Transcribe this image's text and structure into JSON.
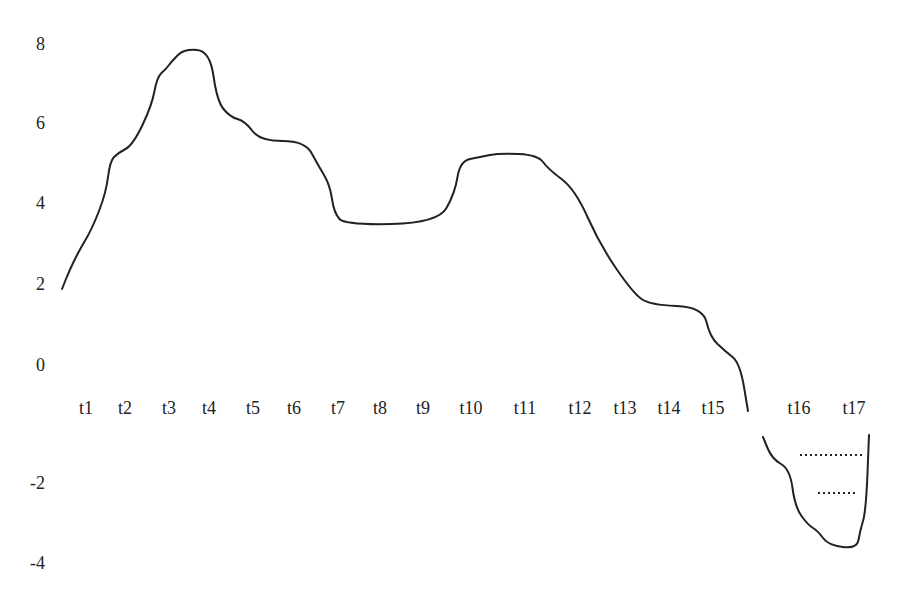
{
  "chart_data": {
    "type": "line",
    "title": "",
    "xlabel": "",
    "ylabel": "",
    "ylim": [
      -4,
      8
    ],
    "grid": false,
    "legend": null,
    "yticks": [
      "8",
      "6",
      "4",
      "2",
      "0",
      "-2",
      "-4"
    ],
    "categories": [
      "t1",
      "t2",
      "t3",
      "t4",
      "t5",
      "t6",
      "t7",
      "t8",
      "t9",
      "t10",
      "t11",
      "t12",
      "t13",
      "t14",
      "t15",
      "t16",
      "t17"
    ],
    "series": [
      {
        "name": "curve",
        "color": "#222222",
        "points": [
          {
            "x": 62,
            "v": 1.9
          },
          {
            "x": 70,
            "v": 2.4
          },
          {
            "x": 80,
            "v": 2.9
          },
          {
            "x": 92,
            "v": 3.4
          },
          {
            "x": 106,
            "v": 4.3
          },
          {
            "x": 110,
            "v": 5.1
          },
          {
            "x": 118,
            "v": 5.3
          },
          {
            "x": 133,
            "v": 5.5
          },
          {
            "x": 152,
            "v": 6.5
          },
          {
            "x": 157,
            "v": 7.2
          },
          {
            "x": 166,
            "v": 7.4
          },
          {
            "x": 172,
            "v": 7.6
          },
          {
            "x": 184,
            "v": 7.9
          },
          {
            "x": 210,
            "v": 7.85
          },
          {
            "x": 217,
            "v": 6.6
          },
          {
            "x": 230,
            "v": 6.2
          },
          {
            "x": 245,
            "v": 6.1
          },
          {
            "x": 260,
            "v": 5.6
          },
          {
            "x": 305,
            "v": 5.6
          },
          {
            "x": 318,
            "v": 5.0
          },
          {
            "x": 330,
            "v": 4.5
          },
          {
            "x": 334,
            "v": 3.8
          },
          {
            "x": 345,
            "v": 3.5
          },
          {
            "x": 438,
            "v": 3.55
          },
          {
            "x": 455,
            "v": 4.3
          },
          {
            "x": 460,
            "v": 5.1
          },
          {
            "x": 480,
            "v": 5.2
          },
          {
            "x": 500,
            "v": 5.3
          },
          {
            "x": 538,
            "v": 5.25
          },
          {
            "x": 548,
            "v": 4.9
          },
          {
            "x": 575,
            "v": 4.4
          },
          {
            "x": 600,
            "v": 3.0
          },
          {
            "x": 633,
            "v": 1.8
          },
          {
            "x": 650,
            "v": 1.5
          },
          {
            "x": 703,
            "v": 1.45
          },
          {
            "x": 710,
            "v": 0.7
          },
          {
            "x": 725,
            "v": 0.35
          },
          {
            "x": 740,
            "v": 0.05
          },
          {
            "x": 748,
            "v": -0.2
          }
        ]
      },
      {
        "name": "curve-lower",
        "color": "#222222",
        "points": [
          {
            "x": 763,
            "v": -0.85
          },
          {
            "x": 772,
            "v": -1.4
          },
          {
            "x": 790,
            "v": -1.65
          },
          {
            "x": 795,
            "v": -2.6
          },
          {
            "x": 808,
            "v": -3.05
          },
          {
            "x": 818,
            "v": -3.2
          },
          {
            "x": 828,
            "v": -3.55
          },
          {
            "x": 857,
            "v": -3.65
          },
          {
            "x": 860,
            "v": -3.2
          },
          {
            "x": 866,
            "v": -2.7
          },
          {
            "x": 869,
            "v": -0.8
          }
        ]
      }
    ],
    "annotations": [
      {
        "type": "dotted-line",
        "x1": 800,
        "x2": 862,
        "v": -1.3
      },
      {
        "type": "dotted-line",
        "x1": 818,
        "x2": 858,
        "v": -2.25
      }
    ]
  }
}
